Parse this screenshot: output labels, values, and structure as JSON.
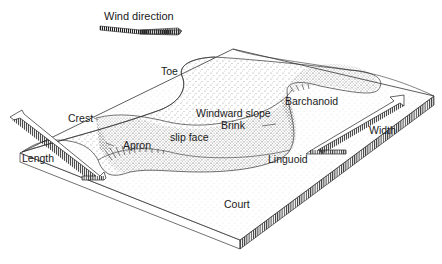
{
  "diagram": {
    "type": "block-diagram",
    "labels": {
      "wind_direction": "Wind direction",
      "toe": "Toe",
      "crest": "Crest",
      "windward_slope": "Windward slope",
      "brink": "Brink",
      "barchanoid": "Barchanoid",
      "slip_face": "slip face",
      "apron": "Apron",
      "linguoid": "Linguoid",
      "length": "Length",
      "width": "Width",
      "court": "Court"
    },
    "colors": {
      "line": "#333333",
      "sand_stipple": "#555555",
      "background": "#ffffff"
    }
  }
}
